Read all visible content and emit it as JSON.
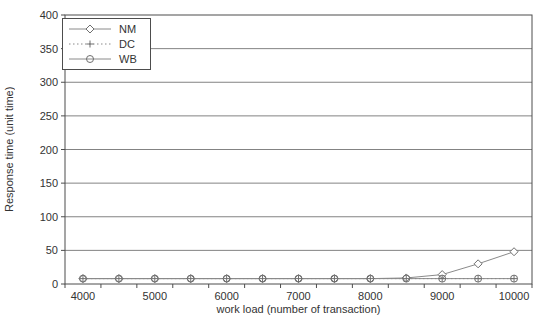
{
  "figure": {
    "background": "#ffffff"
  },
  "chart_data": {
    "type": "line",
    "title": "",
    "xlabel": "work load (number of transaction)",
    "ylabel": "Response time (unit time)",
    "x": [
      4000,
      4500,
      5000,
      5500,
      6000,
      6500,
      7000,
      7500,
      8000,
      8500,
      9000,
      9500,
      10000
    ],
    "xticks": [
      4000,
      5000,
      6000,
      7000,
      8000,
      9000,
      10000
    ],
    "yticks": [
      0,
      50,
      100,
      150,
      200,
      250,
      300,
      350,
      400
    ],
    "ylim": [
      0,
      400
    ],
    "grid": "horizontal-only",
    "legend_position": "top-left-inside",
    "series": [
      {
        "name": "NM",
        "marker": "diamond",
        "line": "solid",
        "values": [
          8,
          8,
          8,
          8,
          8,
          8,
          8,
          8,
          8,
          9,
          14,
          30,
          48
        ]
      },
      {
        "name": "DC",
        "marker": "plus",
        "line": "dotted",
        "values": [
          8,
          8,
          8,
          8,
          8,
          8,
          8,
          8,
          8,
          8,
          8,
          8,
          8
        ]
      },
      {
        "name": "WB",
        "marker": "circle",
        "line": "solid",
        "values": [
          8,
          8,
          8,
          8,
          8,
          8,
          8,
          8,
          8,
          8,
          8,
          8,
          8
        ]
      }
    ],
    "colors": {
      "series_line": "#8a8a8a",
      "marker_stroke": "#6e6e6e",
      "grid": "#4d4d4d",
      "plot_border": "#4d4d4d",
      "text": "#333333",
      "plot_background": "#ffffff"
    }
  }
}
